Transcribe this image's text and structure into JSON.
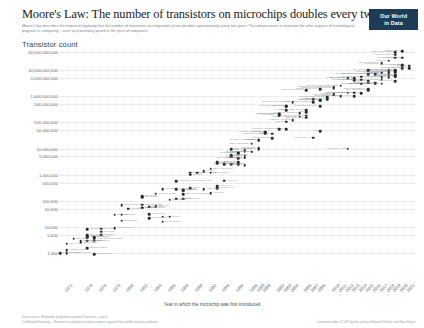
{
  "header": {
    "title": "Moore's Law: The number of transistors on microchips doubles every two years",
    "subtitle": "Moore's law describes the empirical regularity that the number of transistors on integrated circuits doubles approximately every two years. This advancement is important for other aspects of technological progress in computing – such as processing speed or the price of computers.",
    "logo_line1": "Our World",
    "logo_line2": "in Data"
  },
  "axes": {
    "y_title": "Transistor count",
    "x_title": "Year in which the microchip was first introduced",
    "y_ticks": [
      "50,000,000,000",
      "10,000,000,000",
      "5,000,000,000",
      "1,000,000,000",
      "500,000,000",
      "100,000,000",
      "50,000,000",
      "10,000,000",
      "5,000,000",
      "1,000,000",
      "500,000",
      "100,000",
      "50,000",
      "10,000",
      "5,000",
      "1,000"
    ],
    "x_ticks": [
      "1971",
      "1974",
      "1976",
      "1978",
      "1980",
      "1982",
      "1984",
      "1986",
      "1988",
      "1990",
      "1992",
      "1994",
      "1996",
      "1998",
      "1999",
      "2000",
      "2002",
      "2003",
      "2004",
      "2006",
      "2007",
      "2008",
      "2010",
      "2011",
      "2012",
      "2013",
      "2014",
      "2015",
      "2016",
      "2017",
      "2018",
      "2019",
      "2020",
      "2021"
    ]
  },
  "footer": {
    "source": "Data source: Wikipedia (wikipedia.org/wiki/Transistor_count)",
    "link": "OurWorldinData.org – Research and data to make progress against the world's largest problems.",
    "license": "Licensed under CC-BY by the authors Hannah Ritchie and Max Roser."
  },
  "chart_data": {
    "type": "scatter",
    "title": "Moore's Law: The number of transistors on microchips doubles every two years",
    "xlabel": "Year in which the microchip was first introduced",
    "ylabel": "Transistor count",
    "yscale": "log",
    "xlim": [
      1970,
      2022
    ],
    "ylim": [
      1000,
      50000000000
    ],
    "grid": true,
    "legend": "none",
    "points": [
      {
        "label": "Intel 4004",
        "x": 1971,
        "y": 2250
      },
      {
        "label": "Intel 8008",
        "x": 1972,
        "y": 3500
      },
      {
        "label": "MOS Technology 6502",
        "x": 1975,
        "y": 3510
      },
      {
        "label": "Motorola 6800",
        "x": 1974,
        "y": 4100
      },
      {
        "label": "Intel 8080",
        "x": 1974,
        "y": 4500
      },
      {
        "label": "RCA 1802",
        "x": 1974,
        "y": 5000
      },
      {
        "label": "Intel 8085",
        "x": 1976,
        "y": 6500
      },
      {
        "label": "Zilog Z80",
        "x": 1976,
        "y": 8500
      },
      {
        "label": "Motorola 6809",
        "x": 1978,
        "y": 9000
      },
      {
        "label": "Intel 8086",
        "x": 1978,
        "y": 29000
      },
      {
        "label": "Intel 8088",
        "x": 1979,
        "y": 29000
      },
      {
        "label": "ARM 1",
        "x": 1985,
        "y": 25000
      },
      {
        "label": "Motorola 68000",
        "x": 1979,
        "y": 68000
      },
      {
        "label": "Intel 80186",
        "x": 1982,
        "y": 55000
      },
      {
        "label": "Intel 80286",
        "x": 1982,
        "y": 134000
      },
      {
        "label": "ARM 2",
        "x": 1986,
        "y": 25000
      },
      {
        "label": "Motorola 68020",
        "x": 1984,
        "y": 190000
      },
      {
        "label": "Intel 80386",
        "x": 1985,
        "y": 275000
      },
      {
        "label": "ARM 3",
        "x": 1989,
        "y": 310000
      },
      {
        "label": "Motorola 68030",
        "x": 1987,
        "y": 273000
      },
      {
        "label": "Intel 80486",
        "x": 1989,
        "y": 1180000
      },
      {
        "label": "Motorola 68040",
        "x": 1990,
        "y": 1200000
      },
      {
        "label": "R4000",
        "x": 1991,
        "y": 1350000
      },
      {
        "label": "ARM 700",
        "x": 1994,
        "y": 578977
      },
      {
        "label": "Pentium",
        "x": 1993,
        "y": 3100000
      },
      {
        "label": "SA-110",
        "x": 1995,
        "y": 2500000
      },
      {
        "label": "Pentium Pro",
        "x": 1995,
        "y": 5500000
      },
      {
        "label": "AMD K5",
        "x": 1996,
        "y": 4300000
      },
      {
        "label": "Pentium II",
        "x": 1997,
        "y": 7500000
      },
      {
        "label": "AMD K6",
        "x": 1997,
        "y": 8800000
      },
      {
        "label": "Pentium III",
        "x": 1999,
        "y": 9500000
      },
      {
        "label": "AMD K7",
        "x": 1999,
        "y": 22000000
      },
      {
        "label": "Pentium 4",
        "x": 2000,
        "y": 42000000
      },
      {
        "label": "Atom",
        "x": 2008,
        "y": 47000000
      },
      {
        "label": "Barton",
        "x": 2003,
        "y": 54300000
      },
      {
        "label": "AMD K8",
        "x": 2003,
        "y": 105900000
      },
      {
        "label": "Itanium 2 McKinley",
        "x": 2002,
        "y": 220000000
      },
      {
        "label": "Cell",
        "x": 2006,
        "y": 241000000
      },
      {
        "label": "Core 2 Duo Conroe",
        "x": 2006,
        "y": 291000000
      },
      {
        "label": "Core 2 Duo Wolfdale",
        "x": 2008,
        "y": 411000000
      },
      {
        "label": "Itanium 2 Madison 6M",
        "x": 2003,
        "y": 410000000
      },
      {
        "label": "Core i7 (Quad)",
        "x": 2008,
        "y": 731000000
      },
      {
        "label": "Six-core Opteron 2400",
        "x": 2009,
        "y": 904000000
      },
      {
        "label": "Itanium 2 with 9MB cache",
        "x": 2004,
        "y": 592000000
      },
      {
        "label": "Dual-core Itanium 2",
        "x": 2006,
        "y": 1700000000
      },
      {
        "label": "Quad-core Itanium Tukwila",
        "x": 2010,
        "y": 2000000000
      },
      {
        "label": "Six-core Xeon 7400",
        "x": 2008,
        "y": 1900000000
      },
      {
        "label": "Eight-core Xeon Nehalem-EX",
        "x": 2010,
        "y": 2300000000
      },
      {
        "label": "10-core Xeon Westmere-EX",
        "x": 2011,
        "y": 2600000000
      },
      {
        "label": "Apple A7 (dual-core ARM64)",
        "x": 2013,
        "y": 1000000000
      },
      {
        "label": "Qualcomm Snapdragon 821",
        "x": 2016,
        "y": 3000000000
      },
      {
        "label": "IBM z13 Storage Controller",
        "x": 2015,
        "y": 7100000000
      },
      {
        "label": "Xbox One main SoC",
        "x": 2013,
        "y": 5000000000
      },
      {
        "label": "61-core Xeon Phi",
        "x": 2012,
        "y": 5000000000
      },
      {
        "label": "12-core POWER8",
        "x": 2013,
        "y": 4200000000
      },
      {
        "label": "Apple A8X",
        "x": 2014,
        "y": 3000000000
      },
      {
        "label": "IBM z13",
        "x": 2015,
        "y": 3990000000
      },
      {
        "label": "Apple A9X",
        "x": 2015,
        "y": 3300000000
      },
      {
        "label": "22-core Xeon Broadwell-E5",
        "x": 2016,
        "y": 7200000000
      },
      {
        "label": "Apple A10 Fusion",
        "x": 2016,
        "y": 3300000000
      },
      {
        "label": "Apple A11 Bionic",
        "x": 2017,
        "y": 4300000000
      },
      {
        "label": "HiSilicon Kirin 970",
        "x": 2017,
        "y": 5500000000
      },
      {
        "label": "Qualcomm Snapdragon 8cx",
        "x": 2018,
        "y": 8500000000
      },
      {
        "label": "Apple A12X Bionic",
        "x": 2018,
        "y": 10000000000
      },
      {
        "label": "Tegra Xavier SoC",
        "x": 2018,
        "y": 9000000000
      },
      {
        "label": "32-core AMD Epyc",
        "x": 2017,
        "y": 19200000000
      },
      {
        "label": "AWS Graviton2",
        "x": 2019,
        "y": 30000000000
      },
      {
        "label": "Apple M1",
        "x": 2020,
        "y": 16000000000
      },
      {
        "label": "AMD Epyc Rome",
        "x": 2019,
        "y": 39540000000
      },
      {
        "label": "Centriq 2400",
        "x": 2017,
        "y": 18000000000
      },
      {
        "label": "Apple A13 (iPhone 11 Pro)",
        "x": 2019,
        "y": 8500000000
      },
      {
        "label": "HiSilicon Kirin 990 5G",
        "x": 2019,
        "y": 10300000000
      },
      {
        "label": "GC2 IPU",
        "x": 2018,
        "y": 23600000000
      },
      {
        "label": "Xbox Series X SoC",
        "x": 2020,
        "y": 15300000000
      },
      {
        "label": "Apple A14",
        "x": 2020,
        "y": 11800000000
      },
      {
        "label": "IBM z15",
        "x": 2019,
        "y": 9200000000
      },
      {
        "label": "Wafer Scale Engine",
        "x": 2019,
        "y": 50000000000
      },
      {
        "label": "Tesla FSD chip",
        "x": 2019,
        "y": 6000000000
      },
      {
        "label": "Ampere Altra",
        "x": 2020,
        "y": 30000000000
      },
      {
        "label": "SPARC M7",
        "x": 2015,
        "y": 10000000000
      },
      {
        "label": "Qualcomm Snapdragon 835",
        "x": 2017,
        "y": 3000000000
      },
      {
        "label": "Core i7 Broadwell-U",
        "x": 2015,
        "y": 1900000000
      },
      {
        "label": "Duo-core + GPU Iris Core i7",
        "x": 2014,
        "y": 1300000000
      },
      {
        "label": "POWER6",
        "x": 2007,
        "y": 789000000
      },
      {
        "label": "Core i7 Skylake K",
        "x": 2015,
        "y": 1750000000
      },
      {
        "label": "Pentium D Smithfield",
        "x": 2005,
        "y": 228000000
      },
      {
        "label": "Pentium 4 Prescott-2M",
        "x": 2005,
        "y": 169000000
      },
      {
        "label": "Pentium 4 Prescott",
        "x": 2004,
        "y": 125000000
      },
      {
        "label": "Pentium 4 Northwood",
        "x": 2002,
        "y": 55000000
      },
      {
        "label": "Pentium 4 Willamette",
        "x": 2000,
        "y": 42000000
      },
      {
        "label": "ARM Cortex-A9",
        "x": 2007,
        "y": 26000000
      },
      {
        "label": "PA-8800",
        "x": 2003,
        "y": 300000000
      },
      {
        "label": "SPARC64 V",
        "x": 2002,
        "y": 191000000
      },
      {
        "label": "Itanium McKinley",
        "x": 2002,
        "y": 220000000
      },
      {
        "label": "Itanium Merced",
        "x": 2001,
        "y": 25000000
      },
      {
        "label": "ARM Cortex-A53",
        "x": 2012,
        "y": 10000000
      },
      {
        "label": "R10000",
        "x": 1996,
        "y": 6800000
      },
      {
        "label": "SA-110 StrongARM",
        "x": 1996,
        "y": 2500000
      },
      {
        "label": "Pentium MMX",
        "x": 1997,
        "y": 4500000
      },
      {
        "label": "Pentium II Deschutes",
        "x": 1998,
        "y": 7500000
      },
      {
        "label": "Pentium III Coppermine",
        "x": 1999,
        "y": 21000000
      },
      {
        "label": "AMD K6-III",
        "x": 1999,
        "y": 21300000
      },
      {
        "label": "Athlon XP",
        "x": 2001,
        "y": 37500000
      },
      {
        "label": "Itanium 2",
        "x": 2003,
        "y": 410000000
      },
      {
        "label": "Transmeta Crusoe",
        "x": 2000,
        "y": 36800000
      },
      {
        "label": "Hitachi SH-4",
        "x": 1997,
        "y": 2300000
      },
      {
        "label": "Intel 80186 variant",
        "x": 1982,
        "y": 55000
      },
      {
        "label": "TMS 1000",
        "x": 1974,
        "y": 8000
      },
      {
        "label": "Intersil 6100",
        "x": 1975,
        "y": 4000
      },
      {
        "label": "Signetics 2650",
        "x": 1975,
        "y": 900
      },
      {
        "label": "Bellmac-32",
        "x": 1982,
        "y": 150000
      },
      {
        "label": "NEC V20",
        "x": 1984,
        "y": 63000
      },
      {
        "label": "Intel i960",
        "x": 1988,
        "y": 250000
      },
      {
        "label": "WDC 65C816",
        "x": 1983,
        "y": 22000
      },
      {
        "label": "Novix NC4016",
        "x": 1985,
        "y": 16000
      },
      {
        "label": "DEC WRL MultiTitan",
        "x": 1988,
        "y": 180000
      },
      {
        "label": "TI Explorer Lisp machine chip",
        "x": 1987,
        "y": 553000
      },
      {
        "label": "Intel i860",
        "x": 1989,
        "y": 1000000
      },
      {
        "label": "DEC Alpha 21064",
        "x": 1992,
        "y": 1680000
      },
      {
        "label": "DEC Alpha 21164",
        "x": 1995,
        "y": 9300000
      },
      {
        "label": "DEC Alpha 21264",
        "x": 1998,
        "y": 15200000
      },
      {
        "label": "UltraSPARC",
        "x": 1995,
        "y": 5200000
      },
      {
        "label": "UltraSPARC IIi",
        "x": 1997,
        "y": 5400000
      },
      {
        "label": "PowerPC 601",
        "x": 1993,
        "y": 2800000
      },
      {
        "label": "PowerPC 620",
        "x": 1996,
        "y": 6900000
      },
      {
        "label": "PowerPC G4",
        "x": 1999,
        "y": 10500000
      },
      {
        "label": "Motorola 68060",
        "x": 1994,
        "y": 2500000
      },
      {
        "label": "Intel 80960",
        "x": 1988,
        "y": 250000
      },
      {
        "label": "ARM 610",
        "x": 1993,
        "y": 360000
      },
      {
        "label": "Hitachi SH-2",
        "x": 1993,
        "y": 300000
      },
      {
        "label": "Intel Pentium Tillamook",
        "x": 1997,
        "y": 4500000
      },
      {
        "label": "AMD Am386",
        "x": 1991,
        "y": 275000
      },
      {
        "label": "Cyrix 6x86",
        "x": 1996,
        "y": 3000000
      },
      {
        "label": "Intel Celeron",
        "x": 1998,
        "y": 7500000
      },
      {
        "label": "Pentium 4 Cedar Mill",
        "x": 2006,
        "y": 184000000
      },
      {
        "label": "Core Duo Yonah",
        "x": 2006,
        "y": 151000000
      },
      {
        "label": "Core 2 Quad Kentsfield",
        "x": 2007,
        "y": 582000000
      },
      {
        "label": "Core i7 Bloomfield",
        "x": 2008,
        "y": 731000000
      },
      {
        "label": "Core i5 Lynnfield",
        "x": 2009,
        "y": 774000000
      },
      {
        "label": "Core i7 Gulftown",
        "x": 2010,
        "y": 1170000000
      },
      {
        "label": "Core i7 Sandy Bridge",
        "x": 2011,
        "y": 995000000
      },
      {
        "label": "Core i7 Ivy Bridge",
        "x": 2012,
        "y": 1400000000
      },
      {
        "label": "Core i7 Haswell",
        "x": 2013,
        "y": 1400000000
      },
      {
        "label": "Xeon Ivy Bridge-EX",
        "x": 2014,
        "y": 4310000000
      },
      {
        "label": "Xeon Haswell-E5",
        "x": 2014,
        "y": 5560000000
      },
      {
        "label": "Xeon Skylake",
        "x": 2017,
        "y": 8000000000
      },
      {
        "label": "POWER7",
        "x": 2010,
        "y": 1200000000
      },
      {
        "label": "POWER9",
        "x": 2017,
        "y": 8000000000
      },
      {
        "label": "Zen 2 Ryzen",
        "x": 2019,
        "y": 3800000000
      },
      {
        "label": "Nvidia GA100",
        "x": 2020,
        "y": 54200000000
      },
      {
        "label": "Apple A12 Bionic",
        "x": 2018,
        "y": 6900000000
      },
      {
        "label": "HiSilicon Kirin 710",
        "x": 2018,
        "y": 5500000000
      },
      {
        "label": "Snapdragon 855",
        "x": 2019,
        "y": 6700000000
      },
      {
        "label": "Exynos 9820",
        "x": 2019,
        "y": 6000000000
      },
      {
        "label": "Samsung Exynos 2100",
        "x": 2021,
        "y": 12000000000
      },
      {
        "label": "Apple A15",
        "x": 2021,
        "y": 15000000000
      },
      {
        "label": "Intel 8048",
        "x": 1976,
        "y": 5000
      },
      {
        "label": "Fairchild F8",
        "x": 1975,
        "y": 3000
      },
      {
        "label": "Intel 4040",
        "x": 1974,
        "y": 3000
      },
      {
        "label": "National SC/MP",
        "x": 1974,
        "y": 1500
      },
      {
        "label": "Toshiba TLCS-12",
        "x": 1973,
        "y": 2800
      },
      {
        "label": "NEC uCOM-4",
        "x": 1973,
        "y": 2500
      },
      {
        "label": "Intel 3101",
        "x": 1971,
        "y": 1000
      },
      {
        "label": "Mostek MK5065",
        "x": 1971,
        "y": 1250
      },
      {
        "label": "Garrett AiResearch CADC",
        "x": 1970,
        "y": 1000
      },
      {
        "label": "ARM 250",
        "x": 1992,
        "y": 200000
      },
      {
        "label": "Intel 8051",
        "x": 1980,
        "y": 50000
      },
      {
        "label": "Zilog Z8000",
        "x": 1979,
        "y": 17500
      },
      {
        "label": "Motorola 68008",
        "x": 1982,
        "y": 70000
      },
      {
        "label": "Intel 80C51",
        "x": 1983,
        "y": 60000
      },
      {
        "label": "Hitachi 6301",
        "x": 1983,
        "y": 30000
      },
      {
        "label": "MIPS R2000",
        "x": 1986,
        "y": 110000
      },
      {
        "label": "MIPS R3000",
        "x": 1988,
        "y": 120000
      },
      {
        "label": "Intel i486DX2",
        "x": 1992,
        "y": 1200000
      },
      {
        "label": "Intel 80387",
        "x": 1987,
        "y": 120000
      }
    ]
  }
}
